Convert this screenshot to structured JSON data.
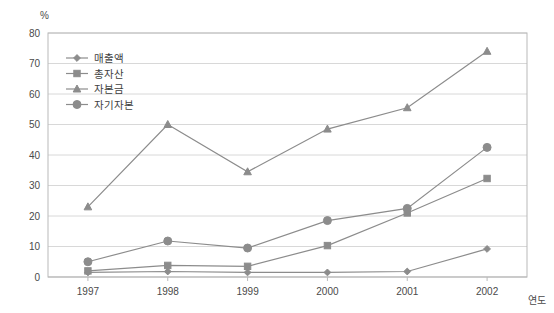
{
  "chart_data": {
    "type": "line",
    "title": "",
    "xlabel": "연도",
    "ylabel": "%",
    "x": [
      "1997",
      "1998",
      "1999",
      "2000",
      "2001",
      "2002"
    ],
    "categories": [
      "1997",
      "1998",
      "1999",
      "2000",
      "2001",
      "2002"
    ],
    "ylim": [
      0,
      80
    ],
    "yticks": [
      "0",
      "10",
      "20",
      "30",
      "40",
      "50",
      "60",
      "70",
      "80"
    ],
    "ytick_values": [
      0,
      10,
      20,
      30,
      40,
      50,
      60,
      70,
      80
    ],
    "grid": true,
    "legend_position": "upper-left-inside",
    "series": [
      {
        "name": "매출액",
        "marker": "diamond",
        "color": "#8c8c8c",
        "values": [
          1.5,
          1.8,
          1.5,
          1.5,
          1.8,
          9.2
        ]
      },
      {
        "name": "총자산",
        "marker": "square",
        "color": "#8c8c8c",
        "values": [
          2.0,
          3.8,
          3.5,
          10.3,
          21.0,
          32.3
        ]
      },
      {
        "name": "자본금",
        "marker": "triangle",
        "color": "#8c8c8c",
        "values": [
          23.0,
          50.0,
          34.5,
          48.5,
          55.5,
          74.0
        ]
      },
      {
        "name": "자기자본",
        "marker": "circle",
        "color": "#8c8c8c",
        "values": [
          5.0,
          11.8,
          9.5,
          18.5,
          22.5,
          42.5
        ]
      }
    ]
  },
  "axis": {
    "unit_label": "%",
    "x_title": "연도"
  }
}
